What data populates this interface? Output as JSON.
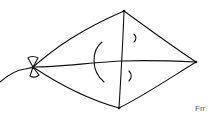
{
  "figure": {
    "stroke_color": "#111111",
    "background": "#ffffff",
    "caption": "Frr"
  },
  "shapes": {
    "kite_outline": "diamond",
    "spars": [
      "vertical-spar",
      "horizontal-spar"
    ],
    "bow": "bow-tie",
    "tail": "string"
  }
}
